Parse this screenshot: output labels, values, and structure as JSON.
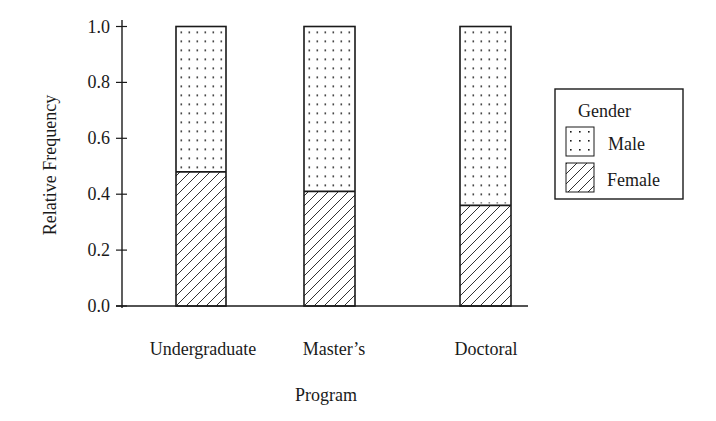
{
  "chart_data": {
    "type": "bar",
    "stacked": true,
    "title": "",
    "xlabel": "Program",
    "ylabel": "Relative Frequency",
    "ylim": [
      0.0,
      1.0
    ],
    "yticks": [
      "0.0",
      "0.2",
      "0.4",
      "0.6",
      "0.8",
      "1.0"
    ],
    "categories": [
      "Undergraduate",
      "Master’s",
      "Doctoral"
    ],
    "series": [
      {
        "name": "Female",
        "pattern": "diagonal-hatch",
        "values": [
          0.48,
          0.41,
          0.36
        ]
      },
      {
        "name": "Male",
        "pattern": "dots",
        "values": [
          0.52,
          0.59,
          0.64
        ]
      }
    ],
    "legend": {
      "title": "Gender",
      "position": "right",
      "entries": [
        "Male",
        "Female"
      ]
    },
    "grid": false,
    "colors": {
      "ink": "#1a1a1a",
      "fill": "#ffffff"
    }
  }
}
